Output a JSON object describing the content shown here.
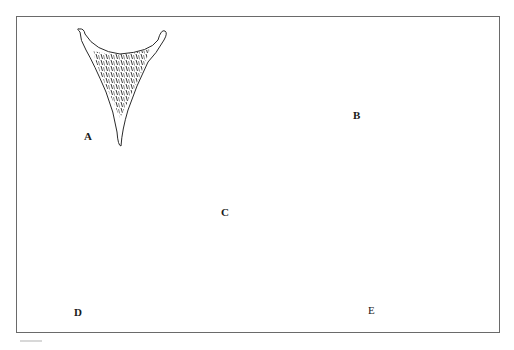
{
  "figure": {
    "type": "scientific line illustration",
    "panel_count": 5,
    "stroke_color": "#2a2a2a",
    "frame_color": "#6a6a6a",
    "background": "#ffffff",
    "panels": [
      {
        "id": "A",
        "label": "A",
        "description": "narrow V-shaped element with curled arms and elongated ridge-like ornamentation, long tapering tip"
      },
      {
        "id": "B",
        "label": "B",
        "description": "broad element with oval end-caps and circular pit ornamentation, short tip"
      },
      {
        "id": "C",
        "label": "C",
        "description": "small Y-shaped element with slender arms and dense dark ornamentation"
      },
      {
        "id": "D",
        "label": "D",
        "description": "wide element with fine stippled band across top and very long slender tip"
      },
      {
        "id": "E",
        "label": "E",
        "description": "upright-armed element with small oval pit ornamentation and pointed tip"
      }
    ]
  }
}
